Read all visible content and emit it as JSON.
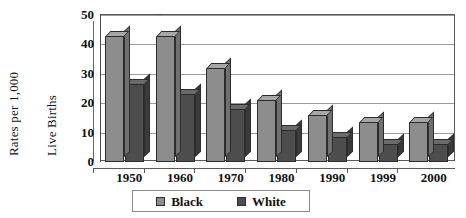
{
  "chart_data": {
    "type": "bar",
    "title": "",
    "xlabel": "",
    "ylabel": "Rates per 1,000 Live Births",
    "ylabel_lines": [
      "Rates per 1,000",
      "Live Births"
    ],
    "categories": [
      "1950",
      "1960",
      "1970",
      "1980",
      "1990",
      "1999",
      "2000"
    ],
    "series": [
      {
        "name": "Black",
        "color": "#8d8d8d",
        "values": [
          43,
          43,
          32,
          21,
          16,
          13.5,
          13.5
        ]
      },
      {
        "name": "White",
        "color": "#4d4d4d",
        "values": [
          26.5,
          23,
          18,
          11,
          8.5,
          6,
          6
        ]
      }
    ],
    "ylim": [
      0,
      50
    ],
    "yticks": [
      0,
      10,
      20,
      30,
      40,
      50
    ],
    "ytick_labels": [
      "0",
      "10",
      "20",
      "30",
      "40",
      "50"
    ],
    "grid": true,
    "grid_axis": "y",
    "legend_position": "bottom-center",
    "style": "3d-column"
  },
  "legend": {
    "items": [
      {
        "label": "Black",
        "swatch": "#8d8d8d"
      },
      {
        "label": "White",
        "swatch": "#4d4d4d"
      }
    ]
  }
}
